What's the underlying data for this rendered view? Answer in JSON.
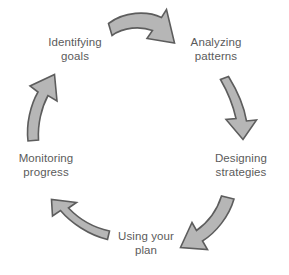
{
  "diagram": {
    "type": "cycle",
    "title": "",
    "direction": "clockwise",
    "stage_count": 5,
    "colors": {
      "arrow_fill": "#b6b6b6",
      "arrow_stroke": "#5d5d5d",
      "label_text": "#5b5b5b",
      "background": "#ffffff"
    },
    "stages": [
      {
        "id": "identifying-goals",
        "label": "Identifying\ngoals",
        "position": "top-left"
      },
      {
        "id": "analyzing-patterns",
        "label": "Analyzing\npatterns",
        "position": "top-right"
      },
      {
        "id": "designing-strategies",
        "label": "Designing\nstrategies",
        "position": "right"
      },
      {
        "id": "using-your-plan",
        "label": "Using your\nplan",
        "position": "bottom"
      },
      {
        "id": "monitoring-progress",
        "label": "Monitoring\nprogress",
        "position": "left"
      }
    ],
    "arrows": [
      {
        "id": "arrow-top",
        "from": "identifying-goals",
        "to": "analyzing-patterns",
        "points": "right-down"
      },
      {
        "id": "arrow-right",
        "from": "analyzing-patterns",
        "to": "designing-strategies",
        "points": "down"
      },
      {
        "id": "arrow-bottom-right",
        "from": "designing-strategies",
        "to": "using-your-plan",
        "points": "down-left"
      },
      {
        "id": "arrow-bottom-left",
        "from": "using-your-plan",
        "to": "monitoring-progress",
        "points": "up-left"
      },
      {
        "id": "arrow-left",
        "from": "monitoring-progress",
        "to": "identifying-goals",
        "points": "up"
      }
    ]
  }
}
